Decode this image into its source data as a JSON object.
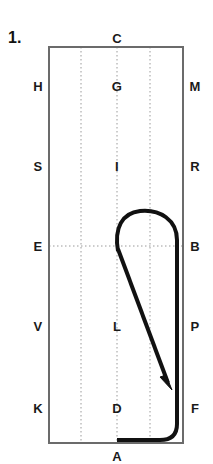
{
  "figure": {
    "problem_number": "1.",
    "colors": {
      "background": "#ffffff",
      "border": "#6b6b6b",
      "grid": "#9a9a9a",
      "stroke": "#111111",
      "label": "#1a1a1a"
    },
    "rectangle": {
      "left": 49,
      "top": 47,
      "right": 183,
      "bottom": 443
    },
    "grid_lines": {
      "vertical_x": [
        81,
        117,
        150
      ],
      "horizontal_y": [
        246
      ]
    },
    "labels": {
      "top": [
        {
          "name": "C",
          "x": 117,
          "y": 38
        }
      ],
      "bottom": [
        {
          "name": "A",
          "x": 117,
          "y": 456
        }
      ],
      "left_column": [
        {
          "name": "H",
          "x": 38,
          "y": 86
        },
        {
          "name": "S",
          "x": 38,
          "y": 166
        },
        {
          "name": "E",
          "x": 38,
          "y": 246
        },
        {
          "name": "V",
          "x": 38,
          "y": 326
        },
        {
          "name": "K",
          "x": 38,
          "y": 408
        }
      ],
      "middle_column": [
        {
          "name": "G",
          "x": 117,
          "y": 86
        },
        {
          "name": "I",
          "x": 117,
          "y": 166
        },
        {
          "name": "L",
          "x": 117,
          "y": 326
        },
        {
          "name": "D",
          "x": 117,
          "y": 408
        }
      ],
      "right_column": [
        {
          "name": "M",
          "x": 195,
          "y": 86
        },
        {
          "name": "R",
          "x": 195,
          "y": 166
        },
        {
          "name": "B",
          "x": 195,
          "y": 246
        },
        {
          "name": "P",
          "x": 195,
          "y": 326
        },
        {
          "name": "F",
          "x": 195,
          "y": 408
        }
      ]
    },
    "paths": {
      "hook_and_stem": "M 118 251 C 114 228 122 213 140 211 C 160 209 177 220 177 240 L 177 408",
      "bottom_hook": "M 177 408 L 177 424 C 177 436 170 440 160 440 L 117 440",
      "arrow_shaft": "M 118 249 L 168 383",
      "arrowhead": "M 172 390 L 160 377 L 166 375 Z"
    },
    "stroke_width": 4
  }
}
